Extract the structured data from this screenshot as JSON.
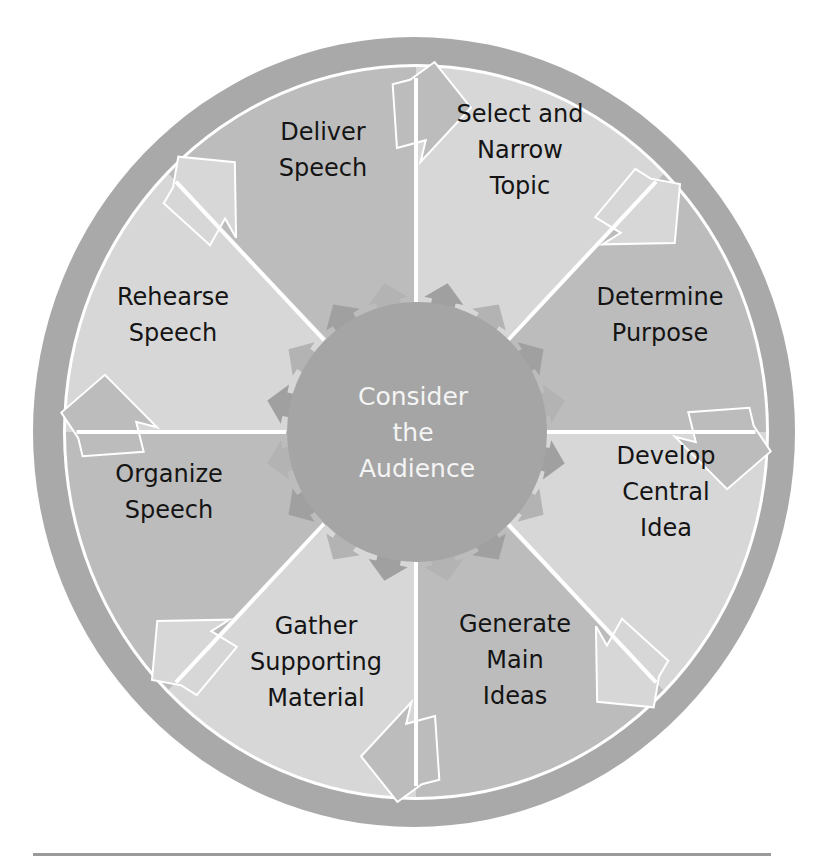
{
  "center": {
    "label_lines": [
      "Consider",
      "the",
      "Audience"
    ],
    "color": "#a5a5a5",
    "text_color": "#f4f4f4"
  },
  "colors": {
    "outer_ring": "#a9a9a9",
    "segment_light": "#d7d7d7",
    "segment_dark": "#bcbcbc",
    "divider": "#ffffff",
    "rule": "#9a9a9a",
    "text": "#141414"
  },
  "steps": [
    {
      "order": 1,
      "label_lines": [
        "Select and",
        "Narrow",
        "Topic"
      ],
      "shade": "light"
    },
    {
      "order": 2,
      "label_lines": [
        "Determine",
        "Purpose"
      ],
      "shade": "dark"
    },
    {
      "order": 3,
      "label_lines": [
        "Develop",
        "Central",
        "Idea"
      ],
      "shade": "light"
    },
    {
      "order": 4,
      "label_lines": [
        "Generate",
        "Main",
        "Ideas"
      ],
      "shade": "dark"
    },
    {
      "order": 5,
      "label_lines": [
        "Gather",
        "Supporting",
        "Material"
      ],
      "shade": "light"
    },
    {
      "order": 6,
      "label_lines": [
        "Organize",
        "Speech"
      ],
      "shade": "dark"
    },
    {
      "order": 7,
      "label_lines": [
        "Rehearse",
        "Speech"
      ],
      "shade": "light"
    },
    {
      "order": 8,
      "label_lines": [
        "Deliver",
        "Speech"
      ],
      "shade": "dark"
    }
  ]
}
